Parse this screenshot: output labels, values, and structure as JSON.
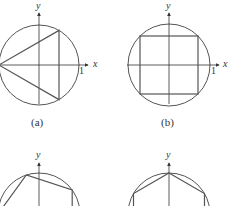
{
  "figure": {
    "colors": {
      "circle": "#555555",
      "polygon": "#555555",
      "axis": "#333333",
      "background": "#ffffff"
    },
    "panels": [
      {
        "id": "a",
        "caption": "(a)",
        "polygon": "triangle",
        "sides": 3,
        "start_angle_deg": 180,
        "x_label": "x",
        "y_label": "y",
        "tick_label": "1"
      },
      {
        "id": "b",
        "caption": "(b)",
        "polygon": "square",
        "sides": 4,
        "start_angle_deg": 45,
        "x_label": "x",
        "y_label": "y",
        "tick_label": "1"
      },
      {
        "id": "c",
        "caption": "",
        "polygon": "pentagon",
        "sides": 5,
        "start_angle_deg": 180,
        "x_label": "",
        "y_label": "y",
        "tick_label": ""
      },
      {
        "id": "d",
        "caption": "",
        "polygon": "hexagon",
        "sides": 6,
        "start_angle_deg": 90,
        "x_label": "",
        "y_label": "y",
        "tick_label": ""
      }
    ]
  }
}
